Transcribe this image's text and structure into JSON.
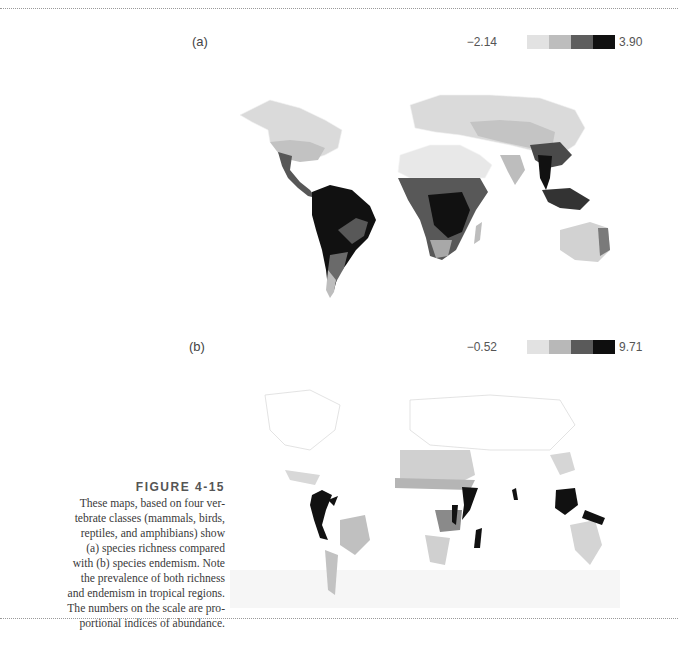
{
  "figure": {
    "label": "FIGURE 4-15",
    "caption_lines": [
      "These maps, based on four ver-",
      "tebrate classes (mammals, birds,",
      "reptiles, and amphibians) show",
      "(a) species richness compared",
      "with (b) species endemism. Note",
      "the prevalence of both richness",
      "and endemism in tropical regions.",
      "The numbers on  the scale are pro-",
      "portional indices of abundance."
    ]
  },
  "panels": [
    {
      "id": "a",
      "label": "(a)",
      "subject": "species richness",
      "scale": {
        "min": "−2.14",
        "max": "3.90",
        "colors": [
          "#e2e2e2",
          "#bdbdbd",
          "#5e5e5e",
          "#111111"
        ]
      }
    },
    {
      "id": "b",
      "label": "(b)",
      "subject": "species endemism",
      "scale": {
        "min": "−0.52",
        "max": "9.71",
        "colors": [
          "#e2e2e2",
          "#b8b8b8",
          "#5a5a5a",
          "#0e0e0e"
        ]
      }
    }
  ]
}
